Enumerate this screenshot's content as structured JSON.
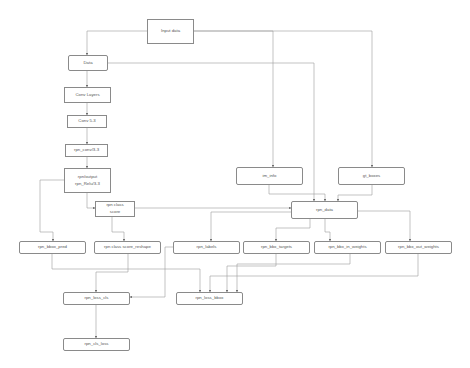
{
  "diagram": {
    "nodes": [
      {
        "id": "input_data",
        "label": "Input data",
        "x": 147,
        "y": 19,
        "w": 47,
        "h": 25,
        "shape": "rect"
      },
      {
        "id": "data",
        "label": "Data",
        "x": 68,
        "y": 55,
        "w": 40,
        "h": 16,
        "shape": "round"
      },
      {
        "id": "conv_layers",
        "label": "Conv Layers",
        "x": 64,
        "y": 87,
        "w": 47,
        "h": 16,
        "shape": "rect"
      },
      {
        "id": "conv5_3",
        "label": "Conv 5-3",
        "x": 67,
        "y": 115,
        "w": 40,
        "h": 13,
        "shape": "rect"
      },
      {
        "id": "rpn_conv",
        "label": "rpn_conv/3-3",
        "x": 65,
        "y": 144,
        "w": 43,
        "h": 13,
        "shape": "rect"
      },
      {
        "id": "rpn_output",
        "label": "rpn/output",
        "label2": "rpn_Relu/3-3",
        "x": 64,
        "y": 168,
        "w": 47,
        "h": 25,
        "shape": "rect"
      },
      {
        "id": "rpn_cls_score",
        "label": "rpn class",
        "label2": "score",
        "x": 95,
        "y": 201,
        "w": 40,
        "h": 16,
        "shape": "rect"
      },
      {
        "id": "rpn_bbox_pred",
        "label": "rpn_bbox_pred",
        "x": 19,
        "y": 241,
        "w": 67,
        "h": 13,
        "shape": "round"
      },
      {
        "id": "rpn_cls_score_reshape",
        "label": "rpn class score_reshape",
        "x": 94,
        "y": 241,
        "w": 67,
        "h": 13,
        "shape": "round"
      },
      {
        "id": "rpn_labels",
        "label": "rpn_labels",
        "x": 173,
        "y": 241,
        "w": 67,
        "h": 13,
        "shape": "round"
      },
      {
        "id": "rpn_bbx_targets",
        "label": "rpn_bbx_targets",
        "x": 243,
        "y": 241,
        "w": 67,
        "h": 13,
        "shape": "round"
      },
      {
        "id": "rpn_bbx_in_weights",
        "label": "rpn_bbx_in_weights",
        "x": 314,
        "y": 241,
        "w": 67,
        "h": 13,
        "shape": "round"
      },
      {
        "id": "rpn_bbx_out_weights",
        "label": "rpn_bbx_out_weights",
        "x": 385,
        "y": 241,
        "w": 67,
        "h": 13,
        "shape": "round"
      },
      {
        "id": "rpn_loss_cls",
        "label": "rpn_loss_cls",
        "x": 63,
        "y": 292,
        "w": 67,
        "h": 13,
        "shape": "round"
      },
      {
        "id": "rpn_loss_bbox",
        "label": "rpn_loss_bbox",
        "x": 176,
        "y": 292,
        "w": 67,
        "h": 13,
        "shape": "round"
      },
      {
        "id": "rpn_cls_loss",
        "label": "rpn_cls_loss",
        "x": 63,
        "y": 338,
        "w": 67,
        "h": 13,
        "shape": "round"
      },
      {
        "id": "im_info",
        "label": "im_info",
        "x": 236,
        "y": 167,
        "w": 67,
        "h": 18,
        "shape": "round"
      },
      {
        "id": "gt_boxes",
        "label": "gt_boxes",
        "x": 338,
        "y": 167,
        "w": 67,
        "h": 18,
        "shape": "round"
      },
      {
        "id": "rpn_data",
        "label": "rpn_data",
        "x": 291,
        "y": 201,
        "w": 67,
        "h": 18,
        "shape": "round"
      }
    ],
    "edges": [
      {
        "from": "input_data",
        "to": "data",
        "path": "M147,31 L87,31 L87,55"
      },
      {
        "from": "input_data",
        "to": "im_info",
        "path": "M194,31 L273,31 L273,167"
      },
      {
        "from": "input_data",
        "to": "gt_boxes",
        "path": "M194,31 L372,31 L372,167"
      },
      {
        "from": "data",
        "to": "rpn_data",
        "path": "M108,63 L314,63 L314,201"
      },
      {
        "from": "data",
        "to": "conv_layers",
        "path": "M87,71 L87,87"
      },
      {
        "from": "conv_layers",
        "to": "conv5_3",
        "path": "M87,103 L87,115"
      },
      {
        "from": "conv5_3",
        "to": "rpn_conv",
        "path": "M87,128 L87,144"
      },
      {
        "from": "rpn_conv",
        "to": "rpn_output",
        "path": "M87,157 L87,168"
      },
      {
        "from": "rpn_output",
        "to": "rpn_cls_score",
        "path": "M87,193 L87,208 L95,208"
      },
      {
        "from": "rpn_output",
        "to": "rpn_bbox_pred",
        "path": "M64,180 L40,180 L40,232 L53,232 L53,241"
      },
      {
        "from": "rpn_cls_score",
        "to": "rpn_cls_score_reshape",
        "path": "M112,217 L112,232 L124,232 L124,241"
      },
      {
        "from": "rpn_cls_score",
        "to": "rpn_data",
        "path": "M135,208 L291,208"
      },
      {
        "from": "im_info",
        "to": "rpn_data",
        "path": "M269,185 L269,194 L325,194 L325,201"
      },
      {
        "from": "gt_boxes",
        "to": "rpn_data",
        "path": "M372,185 L372,195 L338,195 L338,201"
      },
      {
        "from": "rpn_data",
        "to": "rpn_labels",
        "path": "M296,212 L211,212 L211,226 L211,226 L211,241"
      },
      {
        "from": "rpn_data",
        "to": "rpn_bbx_targets",
        "path": "M310,219 L310,228 L276,228 L276,241"
      },
      {
        "from": "rpn_data",
        "to": "rpn_bbx_in_weights",
        "path": "M325,219 L325,232 L330,232 L330,241"
      },
      {
        "from": "rpn_data",
        "to": "rpn_bbx_out_weights",
        "path": "M358,211 L410,211 L410,241"
      },
      {
        "from": "rpn_bbox_pred",
        "to": "rpn_loss_bbox",
        "path": "M52,254 L52,269 L200,269 L200,292"
      },
      {
        "from": "rpn_cls_score_reshape",
        "to": "rpn_loss_cls",
        "path": "M128,254 L128,272 L96,272 L96,292"
      },
      {
        "from": "rpn_labels",
        "to": "rpn_loss_cls",
        "path": "M173,247 L165,247 L165,297 L130,297"
      },
      {
        "from": "rpn_bbx_targets",
        "to": "rpn_loss_bbox",
        "path": "M276,254 L276,266 L227,266 L227,292"
      },
      {
        "from": "rpn_bbx_in_weights",
        "to": "rpn_loss_bbox",
        "path": "M350,254 L350,264 L237,264 L237,292"
      },
      {
        "from": "rpn_bbx_out_weights",
        "to": "rpn_loss_bbox",
        "path": "M418,254 L418,276 L210,276 L210,292"
      },
      {
        "from": "rpn_loss_cls",
        "to": "rpn_cls_loss",
        "path": "M96,305 L96,338"
      }
    ]
  },
  "colors": {
    "line": "#8f8f8f",
    "border": "#8a8a8a",
    "text": "#555555"
  }
}
